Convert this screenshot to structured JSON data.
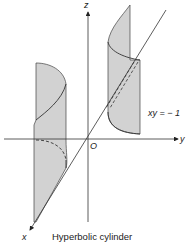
{
  "figure": {
    "caption": "Hyperbolic cylinder",
    "equation": "xy = − 1",
    "axes": {
      "x_label": "x",
      "y_label": "y",
      "z_label": "z",
      "origin_label": "O"
    },
    "colors": {
      "surface_fill": "#d2d2d2",
      "line": "#333333",
      "background": "#ffffff"
    }
  }
}
